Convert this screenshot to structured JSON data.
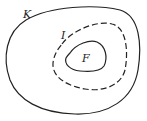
{
  "diagram": {
    "type": "nested-regions",
    "regions": [
      {
        "id": "outer",
        "label": "K",
        "style": "solid"
      },
      {
        "id": "middle",
        "label": "I",
        "style": "dashed"
      },
      {
        "id": "inner",
        "label": "F",
        "style": "solid"
      }
    ],
    "stroke_color": "#222222"
  }
}
